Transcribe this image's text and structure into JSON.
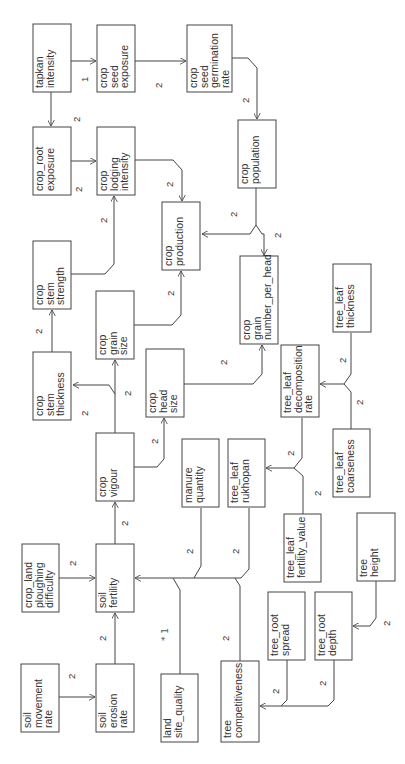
{
  "diagram": {
    "orientation": "rotated-90-ccw",
    "nodes": [
      {
        "id": "tapkan_intensity",
        "lines": [
          "tapkan",
          "intensity"
        ],
        "x": 33,
        "y": 24,
        "w": 38,
        "h": 68
      },
      {
        "id": "crop_seed_exposure",
        "lines": [
          "crop",
          "seed",
          "exposure"
        ],
        "x": 97,
        "y": 25,
        "w": 38,
        "h": 67
      },
      {
        "id": "crop_seed_germination_rate",
        "lines": [
          "crop",
          "seed",
          "germination",
          "rate"
        ],
        "x": 187,
        "y": 25,
        "w": 45,
        "h": 67
      },
      {
        "id": "crop_root_exposure",
        "lines": [
          "crop_root",
          "exposure"
        ],
        "x": 33,
        "y": 127,
        "w": 38,
        "h": 68
      },
      {
        "id": "crop_lodging_intensity",
        "lines": [
          "crop",
          "lodging",
          "intensity"
        ],
        "x": 97,
        "y": 127,
        "w": 38,
        "h": 68
      },
      {
        "id": "crop_population",
        "lines": [
          "crop",
          "population"
        ],
        "x": 238,
        "y": 120,
        "w": 38,
        "h": 68
      },
      {
        "id": "crop_stem_strength",
        "lines": [
          "crop",
          "stem",
          "strength"
        ],
        "x": 33,
        "y": 241,
        "w": 38,
        "h": 68
      },
      {
        "id": "crop_production",
        "lines": [
          "crop",
          "production"
        ],
        "x": 162,
        "y": 202,
        "w": 38,
        "h": 68
      },
      {
        "id": "crop_grain_number_per_head",
        "lines": [
          "crop",
          "grain",
          "number_per_head"
        ],
        "x": 240,
        "y": 256,
        "w": 38,
        "h": 88
      },
      {
        "id": "crop_grain_size",
        "lines": [
          "crop",
          "grain",
          "size"
        ],
        "x": 96,
        "y": 291,
        "w": 38,
        "h": 68
      },
      {
        "id": "tree_leaf_thickness",
        "lines": [
          "tree_leaf",
          "thickness"
        ],
        "x": 333,
        "y": 264,
        "w": 38,
        "h": 68
      },
      {
        "id": "crop_stem_thickness",
        "lines": [
          "crop",
          "stem",
          "thickness"
        ],
        "x": 33,
        "y": 352,
        "w": 38,
        "h": 68
      },
      {
        "id": "crop_head_size",
        "lines": [
          "crop",
          "head",
          "size"
        ],
        "x": 146,
        "y": 349,
        "w": 38,
        "h": 68
      },
      {
        "id": "tree_leaf_decomposition_rate",
        "lines": [
          "tree_leaf",
          "decomposition",
          "rate"
        ],
        "x": 281,
        "y": 345,
        "w": 38,
        "h": 72
      },
      {
        "id": "crop_vigour",
        "lines": [
          "crop",
          "vigour"
        ],
        "x": 96,
        "y": 433,
        "w": 38,
        "h": 68
      },
      {
        "id": "manure_quantity",
        "lines": [
          "manure",
          "quantity"
        ],
        "x": 182,
        "y": 439,
        "w": 37,
        "h": 68
      },
      {
        "id": "tree_leaf_rukhopan",
        "lines": [
          "tree_leaf",
          "rukhopan"
        ],
        "x": 228,
        "y": 439,
        "w": 37,
        "h": 68
      },
      {
        "id": "tree_leaf_coarseness",
        "lines": [
          "tree_leaf",
          "coarseness"
        ],
        "x": 333,
        "y": 429,
        "w": 37,
        "h": 68
      },
      {
        "id": "tree_leaf_fertility_value",
        "lines": [
          "tree_leaf",
          "fertility_value"
        ],
        "x": 284,
        "y": 514,
        "w": 37,
        "h": 68
      },
      {
        "id": "tree_height",
        "lines": [
          "tree",
          "height"
        ],
        "x": 357,
        "y": 513,
        "w": 38,
        "h": 68
      },
      {
        "id": "crop_land_ploughing_difficulty",
        "lines": [
          "crop_land",
          "ploughing",
          "difficulty"
        ],
        "x": 22,
        "y": 544,
        "w": 37,
        "h": 68
      },
      {
        "id": "soil_fertility",
        "lines": [
          "soil",
          "fertility"
        ],
        "x": 96,
        "y": 544,
        "w": 38,
        "h": 68
      },
      {
        "id": "tree_root_spread",
        "lines": [
          "tree_root",
          "spread"
        ],
        "x": 268,
        "y": 592,
        "w": 37,
        "h": 68
      },
      {
        "id": "tree_root_depth",
        "lines": [
          "tree_root",
          "depth"
        ],
        "x": 315,
        "y": 592,
        "w": 37,
        "h": 68
      },
      {
        "id": "soil_movement_rate",
        "lines": [
          "soil",
          "movement",
          "rate"
        ],
        "x": 21,
        "y": 664,
        "w": 38,
        "h": 68
      },
      {
        "id": "soil_erosion_rate",
        "lines": [
          "soil",
          "erosion",
          "rate"
        ],
        "x": 96,
        "y": 664,
        "w": 38,
        "h": 68
      },
      {
        "id": "land_site_quality",
        "lines": [
          "land",
          "site_quality"
        ],
        "x": 161,
        "y": 674,
        "w": 37,
        "h": 68
      },
      {
        "id": "tree_competitiveness",
        "lines": [
          "tree",
          "competitiveness"
        ],
        "x": 221,
        "y": 661,
        "w": 38,
        "h": 81
      }
    ],
    "edges": [
      {
        "from": "tapkan_intensity",
        "to": "crop_seed_exposure",
        "label": "1"
      },
      {
        "from": "crop_seed_exposure",
        "to": "crop_seed_germination_rate",
        "label": "2"
      },
      {
        "from": "crop_seed_germination_rate",
        "to": "crop_population",
        "label": "2"
      },
      {
        "from": "tapkan_intensity",
        "to": "crop_root_exposure",
        "label": "2"
      },
      {
        "from": "crop_root_exposure",
        "to": "crop_lodging_intensity",
        "label": "2"
      },
      {
        "from": "crop_lodging_intensity",
        "to": "crop_production",
        "label": "2"
      },
      {
        "from": "crop_stem_strength",
        "to": "crop_lodging_intensity",
        "label": "2"
      },
      {
        "from": "crop_stem_thickness",
        "to": "crop_stem_strength",
        "label": "2"
      },
      {
        "from": "crop_population",
        "to": "crop_production",
        "label": "2"
      },
      {
        "from": "crop_population",
        "to": "crop_grain_number_per_head",
        "label": "2"
      },
      {
        "from": "crop_grain_size",
        "to": "crop_production",
        "label": "2"
      },
      {
        "from": "crop_head_size",
        "to": "crop_grain_number_per_head",
        "label": "2"
      },
      {
        "from": "crop_vigour",
        "to": "crop_grain_size",
        "label": "2"
      },
      {
        "from": "crop_vigour",
        "to": "crop_stem_thickness",
        "label": "2"
      },
      {
        "from": "crop_vigour",
        "to": "crop_head_size",
        "label": "2"
      },
      {
        "from": "soil_fertility",
        "to": "crop_vigour",
        "label": "2"
      },
      {
        "from": "tree_leaf_thickness",
        "to": "tree_leaf_decomposition_rate",
        "label": "2"
      },
      {
        "from": "tree_leaf_coarseness",
        "to": "tree_leaf_decomposition_rate",
        "label": "2"
      },
      {
        "from": "tree_leaf_decomposition_rate",
        "to": "tree_leaf_rukhopan",
        "label": "2"
      },
      {
        "from": "tree_leaf_fertility_value",
        "to": "tree_leaf_rukhopan",
        "label": "2"
      },
      {
        "from": "manure_quantity",
        "to": "soil_fertility",
        "label": "2"
      },
      {
        "from": "tree_leaf_rukhopan",
        "to": "soil_fertility",
        "label": "2"
      },
      {
        "from": "land_site_quality",
        "to": "soil_fertility",
        "label": "*1"
      },
      {
        "from": "tree_competitiveness",
        "to": "soil_fertility",
        "label": "2"
      },
      {
        "from": "crop_land_ploughing_difficulty",
        "to": "soil_fertility",
        "label": "2"
      },
      {
        "from": "soil_erosion_rate",
        "to": "soil_fertility",
        "label": "2"
      },
      {
        "from": "soil_movement_rate",
        "to": "soil_erosion_rate",
        "label": "2"
      },
      {
        "from": "tree_root_spread",
        "to": "tree_competitiveness",
        "label": "2"
      },
      {
        "from": "tree_root_depth",
        "to": "tree_competitiveness",
        "label": "2"
      },
      {
        "from": "tree_height",
        "to": "tree_root_depth",
        "label": "2"
      }
    ]
  }
}
